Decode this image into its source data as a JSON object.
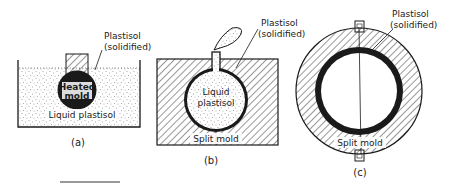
{
  "figure": {
    "panels": [
      {
        "id": "a",
        "caption": "(a)",
        "labels": {
          "plastisol_line1": "Plastisol",
          "plastisol_line2": "(solidified)",
          "heated_line1": "Heated",
          "heated_line2": "mold",
          "liquid": "Liquid plastisol"
        }
      },
      {
        "id": "b",
        "caption": "(b)",
        "labels": {
          "plastisol_line1": "Plastisol",
          "plastisol_line2": "(solidified)",
          "liquid_line1": "Liquid",
          "liquid_line2": "plastisol",
          "split_mold": "Split mold"
        }
      },
      {
        "id": "c",
        "caption": "(c)",
        "labels": {
          "plastisol_line1": "Plastisol",
          "plastisol_line2": "(solidified)",
          "split_mold": "Split mold"
        }
      }
    ],
    "colors": {
      "ink": "#1a1a1a",
      "paper": "#ffffff",
      "stipple": "#555555"
    }
  }
}
